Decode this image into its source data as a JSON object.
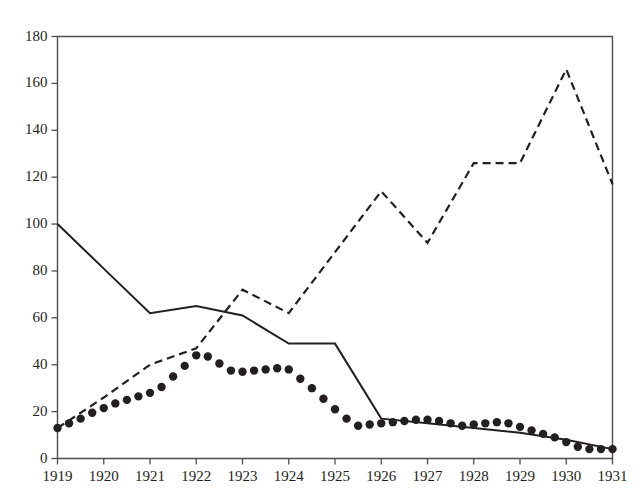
{
  "chart_data": {
    "type": "line",
    "title": "",
    "subtitle": "",
    "xlabel": "",
    "ylabel": "",
    "xlim": [
      1919,
      1931
    ],
    "ylim": [
      0,
      180
    ],
    "grid": false,
    "legend": "none",
    "x_tick_labels": [
      "1919",
      "1920",
      "1921",
      "1922",
      "1923",
      "1924",
      "1925",
      "1926",
      "1927",
      "1928",
      "1929",
      "1930",
      "1931"
    ],
    "y_tick_labels": [
      "0",
      "20",
      "40",
      "60",
      "80",
      "100",
      "120",
      "140",
      "160",
      "180"
    ],
    "x_ticks": [
      1919,
      1920,
      1921,
      1922,
      1923,
      1924,
      1925,
      1926,
      1927,
      1928,
      1929,
      1930,
      1931
    ],
    "y_ticks": [
      0,
      20,
      40,
      60,
      80,
      100,
      120,
      140,
      160,
      180
    ],
    "series": [
      {
        "name": "solid-line",
        "style": "solid",
        "color": "#231f20",
        "x": [
          1919,
          1920,
          1921,
          1922,
          1923,
          1924,
          1925,
          1926,
          1927,
          1928,
          1929,
          1930,
          1931
        ],
        "values": [
          100,
          81,
          62,
          65,
          61,
          49,
          49,
          17,
          15,
          13,
          11,
          8,
          4
        ]
      },
      {
        "name": "dashed-line",
        "style": "dashed",
        "color": "#231f20",
        "x": [
          1919,
          1920,
          1921,
          1922,
          1923,
          1924,
          1925,
          1926,
          1927,
          1928,
          1929,
          1930,
          1931
        ],
        "values": [
          13,
          26,
          40,
          47,
          72,
          62,
          88,
          114,
          92,
          126,
          126,
          166,
          117
        ]
      },
      {
        "name": "dotted-markers",
        "style": "dots",
        "color": "#231f20",
        "x": [
          1919,
          1919.25,
          1919.5,
          1919.75,
          1920,
          1920.25,
          1920.5,
          1920.75,
          1921,
          1921.25,
          1921.5,
          1921.75,
          1922,
          1922.25,
          1922.5,
          1922.75,
          1923,
          1923.25,
          1923.5,
          1923.75,
          1924,
          1924.25,
          1924.5,
          1924.75,
          1925,
          1925.25,
          1925.5,
          1925.75,
          1926,
          1926.25,
          1926.5,
          1926.75,
          1927,
          1927.25,
          1927.5,
          1927.75,
          1928,
          1928.25,
          1928.5,
          1928.75,
          1929,
          1929.25,
          1929.5,
          1929.75,
          1930,
          1930.25,
          1930.5,
          1930.75,
          1931
        ],
        "values": [
          13,
          15,
          17,
          19.5,
          21.5,
          23.5,
          25,
          26.5,
          28,
          30.5,
          35,
          39.5,
          44,
          43.5,
          40.5,
          37.5,
          37,
          37.5,
          38,
          38.5,
          38,
          34,
          30,
          25.5,
          21,
          17,
          14,
          14.5,
          15,
          15.5,
          16,
          16.5,
          16.5,
          16,
          15,
          14,
          14.5,
          15,
          15.5,
          15,
          13.5,
          12,
          10.5,
          9,
          7,
          5,
          4,
          4,
          4
        ]
      }
    ]
  },
  "axis": {
    "y_values": [
      "180",
      "160",
      "140",
      "120",
      "100",
      "80",
      "60",
      "40",
      "20",
      "0"
    ],
    "x_values": [
      "1919",
      "1920",
      "1921",
      "1922",
      "1923",
      "1924",
      "1925",
      "1926",
      "1927",
      "1928",
      "1929",
      "1930",
      "1931"
    ]
  },
  "style": {
    "ink": "#231f20",
    "frame": "#4d4d4d",
    "background": "#ffffff"
  }
}
